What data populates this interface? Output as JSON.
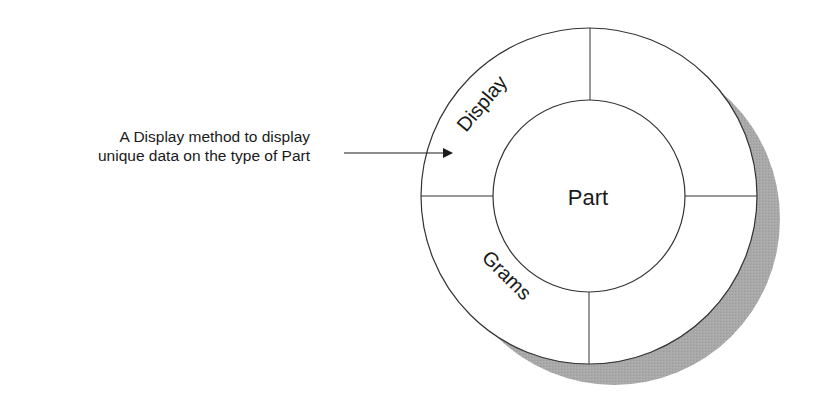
{
  "diagram": {
    "type": "object-encapsulation",
    "center_label": "Part",
    "ring_segments": [
      {
        "position": "upper-left",
        "label": "Display"
      },
      {
        "position": "upper-right",
        "label": ""
      },
      {
        "position": "lower-left",
        "label": "Grams"
      },
      {
        "position": "lower-right",
        "label": ""
      }
    ],
    "annotation": {
      "line1": "A Display method to display",
      "line2": "unique data on the type of Part",
      "points_to": "Display"
    },
    "colors": {
      "stroke": "#333333",
      "fill": "#ffffff",
      "shadow": "#a8a8a8",
      "text": "#1a1a1a"
    }
  }
}
